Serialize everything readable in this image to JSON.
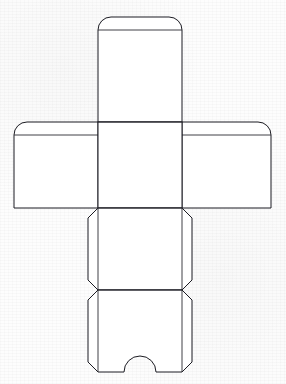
{
  "document": {
    "title": "Cube Box Papercraft Dieline",
    "subject": "box-template",
    "background_color": "#fdfdfd",
    "line_color": "#1b1b22",
    "fill_color": "#ffffff",
    "width": 286,
    "height": 384
  },
  "template": {
    "kind": "cross-layout cube net",
    "panel_count": 6,
    "tab_count": 5,
    "units": "px"
  },
  "geometry": {
    "center_left": 98,
    "center_right": 182,
    "row_top_fold": 122,
    "row_bottom_fold": 208,
    "row2_bottom_fold": 290,
    "bottom_edge": 372,
    "top_panel_top_fold": 38,
    "top_tab_top": 17,
    "left_flap_x": 14,
    "right_flap_x": 271,
    "flap_top": 115,
    "side_tab_left_x": 85,
    "side_tab_right_x": 195,
    "chamfer": 10,
    "corner_radius": 13,
    "notch_radius": 16,
    "notch_center_x": 140
  },
  "parts": {
    "top_panel": {
      "name": "Top panel",
      "tab": "rounded glue tab"
    },
    "left_panel": {
      "name": "Left side panel",
      "tab": "rounded glue tab"
    },
    "right_panel": {
      "name": "Right side panel",
      "tab": "rounded glue tab"
    },
    "center_panel": {
      "name": "Center face panel",
      "tab": "none"
    },
    "middle_panel": {
      "name": "Middle panel",
      "tab": "chamfered side tabs"
    },
    "bottom_panel": {
      "name": "Bottom panel",
      "tab": "chamfered side tabs with thumb notch"
    }
  },
  "notch": {
    "name": "Thumb notch",
    "shape": "semicircular arc",
    "radius": 16
  }
}
